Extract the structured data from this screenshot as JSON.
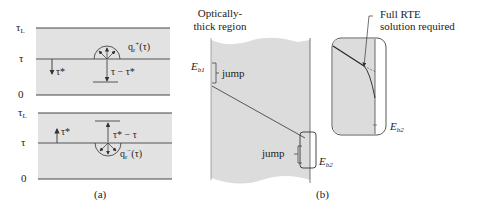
{
  "figure": {
    "panel_a": {
      "caption": "(a)",
      "top": {
        "labels": {
          "tau_L": "τ",
          "tau_L_sub": "L",
          "tau": "τ",
          "zero": "0"
        },
        "tau_star": "τ*",
        "distance": "τ − τ*",
        "flux": "q",
        "flux_sub": "r",
        "flux_sup": "+",
        "flux_arg": "(τ)"
      },
      "bottom": {
        "labels": {
          "tau_L": "τ",
          "tau_L_sub": "L",
          "tau": "τ",
          "zero": "0"
        },
        "tau_star": "τ*",
        "distance": "τ* − τ",
        "flux": "q",
        "flux_sub": "r",
        "flux_sup": "−",
        "flux_arg": "(τ)"
      }
    },
    "panel_b": {
      "caption": "(b)",
      "region_title_line1": "Optically-",
      "region_title_line2": "thick region",
      "eb1": "E",
      "eb1_sub": "b1",
      "eb2": "E",
      "eb2_sub": "b2",
      "jump_top": "jump",
      "jump_bottom": "jump",
      "inset_note_line1": "Full RTE",
      "inset_note_line2": "solution required",
      "inset_eb2": "E",
      "inset_eb2_sub": "b2"
    },
    "colors": {
      "slab_fill": "#e2e2e2",
      "line": "#333333",
      "region_fill": "#dcdcdc"
    }
  }
}
